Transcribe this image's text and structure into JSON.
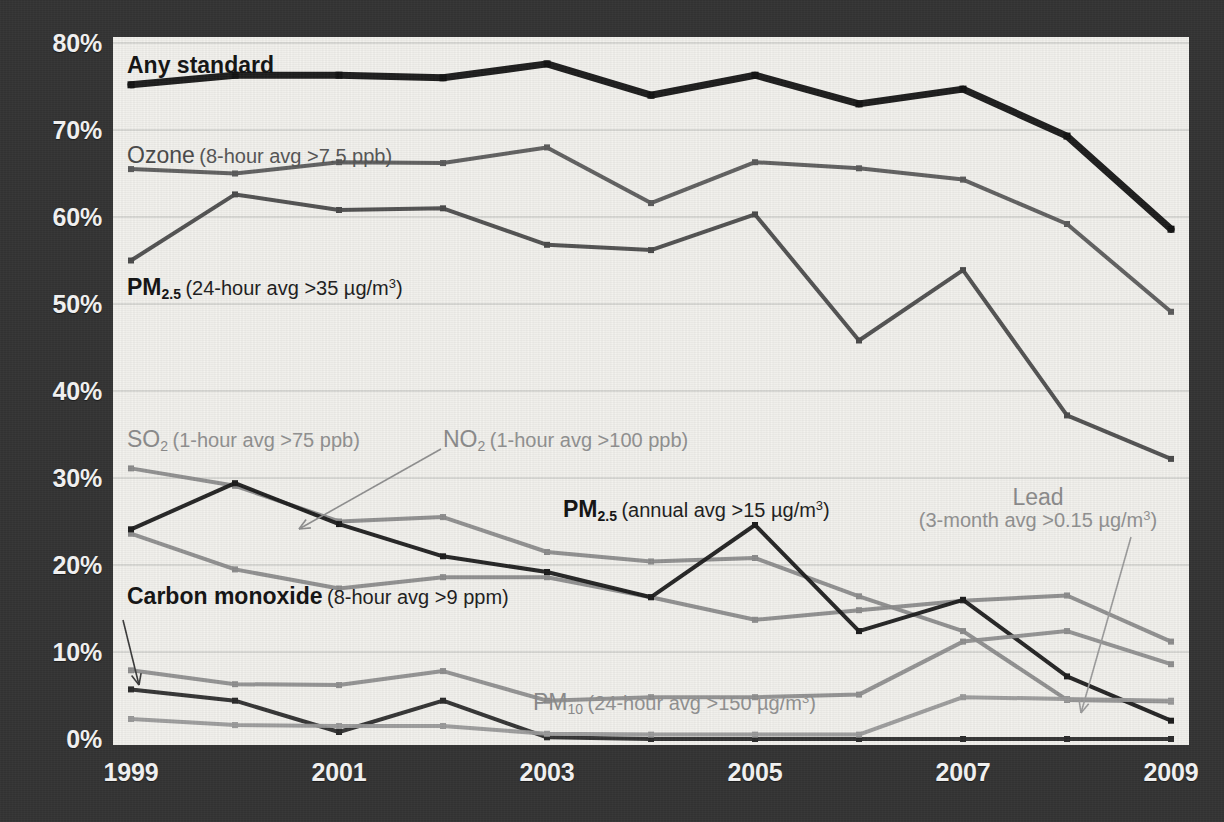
{
  "figure": {
    "background_color": "#343434",
    "plot_background_color": "#f3f2ee",
    "note": "scanned/photocopied line chart, greyscale"
  },
  "axes": {
    "y_ticks": [
      "0%",
      "10%",
      "20%",
      "30%",
      "40%",
      "50%",
      "60%",
      "70%",
      "80%"
    ],
    "x_ticks": [
      "1999",
      "2001",
      "2003",
      "2005",
      "2007",
      "2009"
    ]
  },
  "annotations": [
    {
      "id": "any-standard",
      "name": "Any standard",
      "qualifier": "",
      "tone": "dark"
    },
    {
      "id": "ozone",
      "name": "Ozone",
      "qualifier": "(8-hour avg >7.5 ppb)",
      "tone": "mid"
    },
    {
      "id": "pm25-24hr",
      "name": "PM2.5",
      "name_base": "PM",
      "name_sub": "2.5",
      "qualifier": "(24-hour avg >35 µg/m3)",
      "qualifier_base": "(24-hour avg >35 µg/m",
      "qualifier_sup": "3",
      "qualifier_tail": ")",
      "tone": "dark"
    },
    {
      "id": "so2",
      "name": "SO2",
      "name_base": "SO",
      "name_sub": "2",
      "qualifier": "(1-hour avg >75 ppb)",
      "tone": "light"
    },
    {
      "id": "no2",
      "name": "NO2",
      "name_base": "NO",
      "name_sub": "2",
      "qualifier": "(1-hour avg >100 ppb)",
      "tone": "light"
    },
    {
      "id": "pm25-annual",
      "name": "PM2.5",
      "name_base": "PM",
      "name_sub": "2.5",
      "qualifier": "(annual avg >15 µg/m3)",
      "qualifier_base": "(annual avg >15 µg/m",
      "qualifier_sup": "3",
      "qualifier_tail": ")",
      "tone": "dark"
    },
    {
      "id": "carbon-monoxide",
      "name": "Carbon monoxide",
      "qualifier": "(8-hour avg >9 ppm)",
      "tone": "dark"
    },
    {
      "id": "pm10",
      "name": "PM10",
      "name_base": "PM",
      "name_sub": "10",
      "qualifier": "(24-hour avg >150 µg/m3)",
      "qualifier_base": "(24-hour avg >150 µg/m",
      "qualifier_sup": "3",
      "qualifier_tail": ")",
      "tone": "light"
    },
    {
      "id": "lead",
      "name": "Lead",
      "qualifier": "(3-month avg >0.15 µg/m3)",
      "qualifier_base": "(3-month avg >0.15 µg/m",
      "qualifier_sup": "3",
      "qualifier_tail": ")",
      "tone": "light"
    }
  ],
  "chart_data": {
    "type": "line",
    "title": "",
    "xlabel": "",
    "ylabel": "",
    "x": [
      1999,
      2000,
      2001,
      2002,
      2003,
      2004,
      2005,
      2006,
      2007,
      2008,
      2009
    ],
    "xlim": [
      1999,
      2009
    ],
    "ylim": [
      0,
      80
    ],
    "y_unit": "%",
    "y_ticks": [
      0,
      10,
      20,
      30,
      40,
      50,
      60,
      70,
      80
    ],
    "x_ticks_labeled": [
      1999,
      2001,
      2003,
      2005,
      2007,
      2009
    ],
    "grid": "horizontal",
    "legend": "inline-annotations",
    "series": [
      {
        "name": "Any standard",
        "qualifier": "",
        "color": "#111111",
        "width": 7,
        "values": [
          75.2,
          76.3,
          76.3,
          76.0,
          77.6,
          74.0,
          76.3,
          73.0,
          74.7,
          69.3,
          58.6
        ]
      },
      {
        "name": "Ozone",
        "qualifier": "(8-hour avg >7.5 ppb)",
        "color": "#5a5a5a",
        "width": 4,
        "values": [
          65.5,
          65.0,
          66.3,
          66.2,
          68.0,
          61.6,
          66.3,
          65.6,
          64.3,
          59.2,
          49.1
        ]
      },
      {
        "name": "PM2.5 (24-hour)",
        "qualifier": "(24-hour avg >35 µg/m3)",
        "color": "#4a4a4a",
        "width": 4,
        "values": [
          55.0,
          62.6,
          60.8,
          61.0,
          56.8,
          56.2,
          60.3,
          45.8,
          53.9,
          37.2,
          32.2
        ]
      },
      {
        "name": "SO2",
        "qualifier": "(1-hour avg >75 ppb)",
        "color": "#8c8c8c",
        "width": 4,
        "values": [
          31.1,
          29.1,
          25.0,
          25.5,
          21.5,
          20.4,
          20.8,
          16.4,
          12.4,
          4.5,
          4.3
        ]
      },
      {
        "name": "NO2",
        "qualifier": "(1-hour avg >100 ppb)",
        "color": "#8c8c8c",
        "width": 4,
        "values": [
          23.6,
          19.5,
          17.3,
          18.6,
          18.6,
          16.3,
          13.7,
          14.8,
          15.9,
          16.5,
          11.2
        ]
      },
      {
        "name": "PM2.5 (annual)",
        "qualifier": "(annual avg >15 µg/m3)",
        "color": "#1a1a1a",
        "width": 4,
        "values": [
          24.1,
          29.4,
          24.7,
          21.0,
          19.2,
          16.3,
          24.6,
          12.4,
          16.0,
          7.2,
          2.1
        ]
      },
      {
        "name": "Carbon monoxide",
        "qualifier": "(8-hour avg >9 ppm)",
        "color": "#2a2a2a",
        "width": 4,
        "values": [
          5.7,
          4.4,
          0.8,
          4.4,
          0.2,
          0.0,
          0.0,
          0.0,
          0.0,
          0.0,
          0.0
        ]
      },
      {
        "name": "PM10",
        "qualifier": "(24-hour avg >150 µg/m3)",
        "color": "#8f8f8f",
        "width": 4,
        "values": [
          7.9,
          6.3,
          6.2,
          7.8,
          4.4,
          4.8,
          4.8,
          5.1,
          11.2,
          12.4,
          8.6
        ]
      },
      {
        "name": "Lead",
        "qualifier": "(3-month avg >0.15 µg/m3)",
        "color": "#9a9a9a",
        "width": 4,
        "values": [
          2.3,
          1.6,
          1.5,
          1.5,
          0.6,
          0.5,
          0.5,
          0.5,
          4.8,
          4.6,
          4.4
        ]
      }
    ]
  }
}
